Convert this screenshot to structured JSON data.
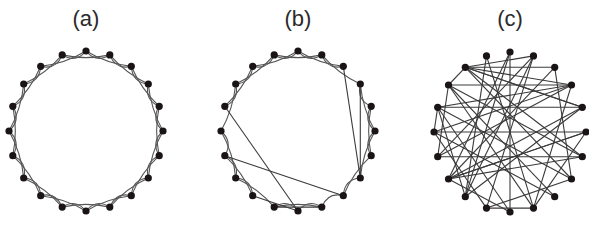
{
  "figure": {
    "background": "#ffffff",
    "node_color": "#1a1414",
    "edge_color": "#555555",
    "node_radius": 3.6,
    "panels": [
      {
        "id": "a",
        "label": "(a)",
        "label_pos": [
          86,
          26
        ],
        "description": "Regular ring lattice, 20 nodes, each linked to nearest and next-nearest neighbours",
        "center": [
          86,
          131
        ],
        "rx": 77,
        "ry": 80,
        "n": 20,
        "lattice_k": 2,
        "removed_lattice_edges": [],
        "chords": []
      },
      {
        "id": "b",
        "label": "(b)",
        "label_pos": [
          298,
          26
        ],
        "description": "Small-world network: ring lattice with a few rewired long-range edges",
        "center": [
          298,
          131
        ],
        "rx": 77,
        "ry": 80,
        "n": 20,
        "lattice_k": 2,
        "removed_lattice_edges": [
          [
            2,
            4
          ],
          [
            7,
            9
          ],
          [
            8,
            10
          ],
          [
            14,
            16
          ],
          [
            10,
            12
          ],
          [
            15,
            16
          ],
          [
            2,
            3
          ],
          [
            6,
            7
          ],
          [
            11,
            12
          ]
        ],
        "chords": [
          [
            2,
            7
          ],
          [
            3,
            7
          ],
          [
            16,
            10
          ],
          [
            14,
            8
          ],
          [
            12,
            10
          ],
          [
            11,
            9
          ]
        ]
      },
      {
        "id": "c",
        "label": "(c)",
        "label_pos": [
          510,
          26
        ],
        "description": "Random network, 20 nodes, edges placed at random",
        "center": [
          510,
          132
        ],
        "rx": 76,
        "ry": 80,
        "n": 20,
        "lattice_k": 0,
        "removed_lattice_edges": [],
        "chords": [
          [
            18,
            2
          ],
          [
            18,
            3
          ],
          [
            18,
            1
          ],
          [
            18,
            4
          ],
          [
            18,
            7
          ],
          [
            18,
            6
          ],
          [
            18,
            4
          ],
          [
            19,
            9
          ],
          [
            19,
            12
          ],
          [
            0,
            10
          ],
          [
            0,
            13
          ],
          [
            0,
            12
          ],
          [
            1,
            12
          ],
          [
            1,
            14
          ],
          [
            1,
            11
          ],
          [
            2,
            7
          ],
          [
            2,
            13
          ],
          [
            3,
            17
          ],
          [
            3,
            15
          ],
          [
            3,
            16
          ],
          [
            3,
            14
          ],
          [
            3,
            9
          ],
          [
            4,
            16
          ],
          [
            4,
            13
          ],
          [
            4,
            12
          ],
          [
            5,
            15
          ],
          [
            5,
            9
          ],
          [
            6,
            14
          ],
          [
            6,
            13
          ],
          [
            6,
            17
          ],
          [
            7,
            16
          ],
          [
            7,
            11
          ],
          [
            8,
            15
          ],
          [
            8,
            17
          ],
          [
            9,
            11
          ],
          [
            9,
            17
          ],
          [
            10,
            13
          ],
          [
            10,
            16
          ],
          [
            11,
            15
          ],
          [
            12,
            16
          ],
          [
            13,
            5
          ],
          [
            14,
            17
          ],
          [
            15,
            16
          ],
          [
            17,
            18
          ],
          [
            5,
            13
          ]
        ]
      }
    ]
  }
}
